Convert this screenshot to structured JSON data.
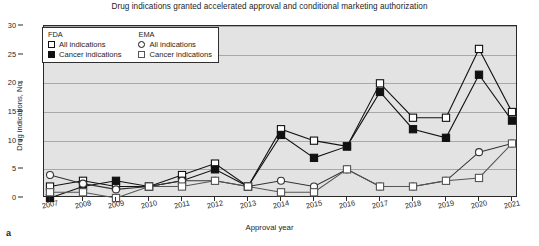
{
  "figure": {
    "title": "Drug indications granted accelerated approval and conditional marketing authorization",
    "panel_label": "a"
  },
  "legend": {
    "groups": [
      {
        "name": "FDA",
        "entries": [
          {
            "label": "All indications",
            "marker": "square-open"
          },
          {
            "label": "Cancer indications",
            "marker": "square-filled"
          }
        ]
      },
      {
        "name": "EMA",
        "entries": [
          {
            "label": "All indications",
            "marker": "circle-open"
          },
          {
            "label": "Cancer indications",
            "marker": "square-light"
          }
        ]
      }
    ]
  },
  "chart_data": {
    "type": "line",
    "title": "Drug indications granted accelerated approval and conditional marketing authorization",
    "xlabel": "Approval year",
    "ylabel": "Drug indications, No.",
    "x": [
      2007,
      2008,
      2009,
      2010,
      2011,
      2012,
      2013,
      2014,
      2015,
      2016,
      2017,
      2018,
      2019,
      2020,
      2021
    ],
    "xlim": [
      2007,
      2021
    ],
    "ylim": [
      0,
      30
    ],
    "yticks": [
      0,
      5,
      10,
      15,
      20,
      25,
      30
    ],
    "grid": true,
    "legend_position": "top-left",
    "series": [
      {
        "name": "FDA All indications",
        "marker": "square-open",
        "color": "#111111",
        "values": [
          2,
          3,
          2,
          2,
          4,
          6,
          2,
          12,
          10,
          9,
          20,
          14,
          14,
          26,
          15
        ]
      },
      {
        "name": "FDA Cancer indications",
        "marker": "square-filled",
        "color": "#111111",
        "values": [
          0,
          2,
          3,
          2,
          3,
          5,
          2,
          11,
          7,
          9,
          18.5,
          12,
          10.5,
          21.5,
          13.5
        ]
      },
      {
        "name": "EMA All indications",
        "marker": "circle-open",
        "color": "#333333",
        "values": [
          4,
          2.5,
          1.5,
          2,
          3,
          3,
          2,
          3,
          2,
          5,
          2,
          2,
          3,
          8,
          9.5
        ]
      },
      {
        "name": "EMA Cancer indications",
        "marker": "square-light",
        "color": "#555555",
        "values": [
          1,
          1,
          0,
          2,
          2,
          3,
          2,
          1,
          1,
          5,
          2,
          2,
          3,
          3.5,
          9.5
        ]
      }
    ]
  }
}
